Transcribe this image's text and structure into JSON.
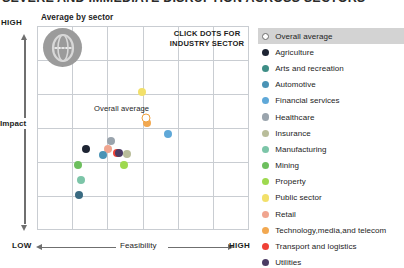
{
  "headline": {
    "text": "SEVERE AND IMMEDIATE DISRUPTION ACROSS SECTORS"
  },
  "chart_title": "Average by sector",
  "annotation": {
    "click_note": "CLICK DOTS FOR INDUSTRY SECTOR"
  },
  "axes": {
    "y": {
      "label": "Impact",
      "high": "HIGH"
    },
    "x": {
      "label": "Feasibility",
      "low": "LOW",
      "high": "HIGH"
    }
  },
  "overall_average_label": "Overall average",
  "legend": {
    "header": {
      "label": "Overall average",
      "color": "#ffffff",
      "style": "hollow"
    },
    "items": [
      {
        "label": "Agriculture",
        "color": "#1d2433"
      },
      {
        "label": "Arts and recreation",
        "color": "#3e8e86"
      },
      {
        "label": "Automotive",
        "color": "#4a93b5"
      },
      {
        "label": "Financial services",
        "color": "#5fa8d8"
      },
      {
        "label": "Healthcare",
        "color": "#9aa4ad"
      },
      {
        "label": "Insurance",
        "color": "#b9bd9a"
      },
      {
        "label": "Manufacturing",
        "color": "#7cc5a8"
      },
      {
        "label": "Mining",
        "color": "#6dbf5e"
      },
      {
        "label": "Property",
        "color": "#9ed94f"
      },
      {
        "label": "Public sector",
        "color": "#f2e06a"
      },
      {
        "label": "Retail",
        "color": "#f0a58f"
      },
      {
        "label": "Technology,media,and telecom",
        "color": "#f2a850"
      },
      {
        "label": "Transport and logistics",
        "color": "#ef4136"
      },
      {
        "label": "Utilities",
        "color": "#4b3b63"
      }
    ]
  },
  "chart_data": {
    "type": "scatter",
    "title": "Average by sector",
    "xlabel": "Feasibility",
    "ylabel": "Impact",
    "xlim": [
      0,
      6
    ],
    "ylim": [
      0,
      6
    ],
    "grid": true,
    "legend_position": "right",
    "annotations": [
      "CLICK DOTS FOR INDUSTRY SECTOR",
      "Overall average"
    ],
    "points": [
      {
        "name": "Overall average",
        "x": 3.08,
        "y": 3.28,
        "color": "#ffffff",
        "style": "hollow"
      },
      {
        "name": "Technology,media,and telecom",
        "x": 3.12,
        "y": 3.14,
        "color": "#f2a850"
      },
      {
        "name": "Public sector",
        "x": 2.98,
        "y": 4.07,
        "color": "#f2e06a"
      },
      {
        "name": "Financial services",
        "x": 3.7,
        "y": 2.83,
        "color": "#5fa8d8"
      },
      {
        "name": "Healthcare",
        "x": 2.1,
        "y": 2.62,
        "color": "#9aa4ad"
      },
      {
        "name": "Agriculture",
        "x": 1.4,
        "y": 2.38,
        "color": "#1d2433"
      },
      {
        "name": "Retail",
        "x": 2.02,
        "y": 2.37,
        "color": "#f0a58f"
      },
      {
        "name": "Transport and logistics",
        "x": 2.26,
        "y": 2.26,
        "color": "#ef4136"
      },
      {
        "name": "Utilities",
        "x": 2.33,
        "y": 2.27,
        "color": "#4b3b63"
      },
      {
        "name": "Insurance",
        "x": 2.55,
        "y": 2.24,
        "color": "#b9bd9a"
      },
      {
        "name": "Automotive",
        "x": 1.86,
        "y": 2.21,
        "color": "#4a93b5"
      },
      {
        "name": "Mining",
        "x": 1.15,
        "y": 1.92,
        "color": "#6dbf5e"
      },
      {
        "name": "Property",
        "x": 2.46,
        "y": 1.9,
        "color": "#9ed94f"
      },
      {
        "name": "Manufacturing",
        "x": 1.25,
        "y": 1.48,
        "color": "#7cc5a8"
      },
      {
        "name": "Arts and recreation",
        "x": 1.18,
        "y": 1.02,
        "color": "#3a6b82"
      }
    ]
  }
}
